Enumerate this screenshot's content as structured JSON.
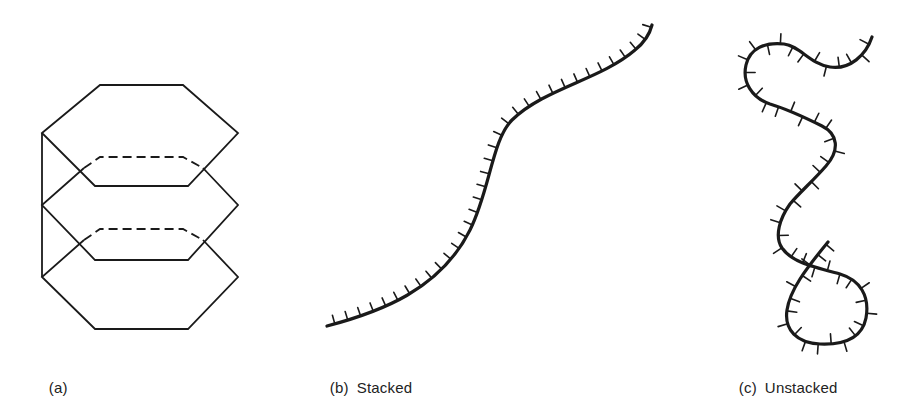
{
  "figure": {
    "panels": [
      {
        "id": "a",
        "tag": "(a)",
        "caption": ""
      },
      {
        "id": "b",
        "tag": "(b)",
        "caption": "Stacked"
      },
      {
        "id": "c",
        "tag": "(c)",
        "caption": "Unstacked"
      }
    ],
    "colors": {
      "ink": "#1a1a1a",
      "background": "#ffffff"
    }
  }
}
